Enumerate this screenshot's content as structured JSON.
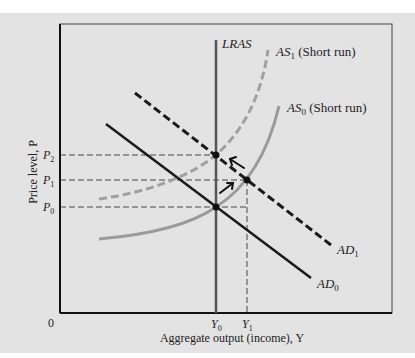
{
  "diagram": {
    "type": "AD-AS model",
    "axes": {
      "x_label": "Aggregate output (income), Y",
      "y_label": "Price level, P",
      "origin_label": "0"
    },
    "y_ticks": [
      {
        "label": "P",
        "sub": "2"
      },
      {
        "label": "P",
        "sub": "1"
      },
      {
        "label": "P",
        "sub": "0"
      }
    ],
    "x_ticks": [
      {
        "label": "Y",
        "sub": "0"
      },
      {
        "label": "Y",
        "sub": "1"
      }
    ],
    "curves": {
      "lras": {
        "label": "LRAS"
      },
      "as1": {
        "label": "AS",
        "sub": "1",
        "suffix": " (Short run)"
      },
      "as0": {
        "label": "AS",
        "sub": "0",
        "suffix": " (Short run)"
      },
      "ad1": {
        "label": "AD",
        "sub": "1"
      },
      "ad0": {
        "label": "AD",
        "sub": "0"
      }
    },
    "colors": {
      "background": "#e3e3e3",
      "axis": "#111111",
      "lras": "#555555",
      "as_curves": "#9a9a9a",
      "ad_curves": "#1a1a1a"
    }
  }
}
